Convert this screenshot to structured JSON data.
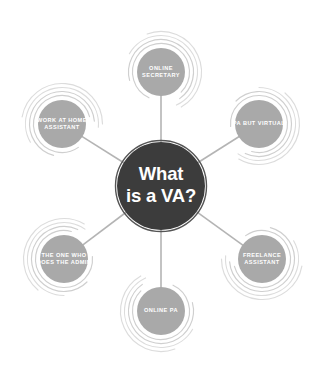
{
  "diagram": {
    "type": "mind-map",
    "background_color": "#ffffff",
    "center": {
      "id": "center-node",
      "lines": [
        "What",
        "is a VA?"
      ],
      "fill_color": "#3c3c3c",
      "text_color": "#ffffff",
      "cx": 161,
      "cy": 186,
      "r": 44
    },
    "node_style": {
      "fill_color": "#a9a9a9",
      "text_color": "#ffffff",
      "arc_color": "#cfcfcf",
      "connector_color": "#b4b4b4",
      "radius": 24
    },
    "nodes": [
      {
        "id": "node-online-secretary",
        "name": "online-secretary",
        "lines": [
          "ONLINE",
          "SECRETARY"
        ],
        "cx": 161,
        "cy": 72,
        "angle": -90
      },
      {
        "id": "node-pa-but-virtual",
        "name": "pa-but-virtual",
        "lines": [
          "PA BUT VIRTUAL"
        ],
        "cx": 259,
        "cy": 124,
        "angle": -30
      },
      {
        "id": "node-freelance-assistant",
        "name": "freelance-assistant",
        "lines": [
          "FREELANCE",
          "ASSISTANT"
        ],
        "cx": 262,
        "cy": 259,
        "angle": 30
      },
      {
        "id": "node-online-pa",
        "name": "online-pa",
        "lines": [
          "ONLINE PA"
        ],
        "cx": 161,
        "cy": 311,
        "angle": 90
      },
      {
        "id": "node-the-one-who-does-the-admin",
        "name": "the-one-who-does-the-admin",
        "lines": [
          "THE ONE WHO",
          "DOES THE ADMIN"
        ],
        "cx": 64,
        "cy": 259,
        "angle": 150
      },
      {
        "id": "node-work-at-home-assistant",
        "name": "work-at-home-assistant",
        "lines": [
          "WORK AT HOME",
          "ASSISTANT"
        ],
        "cx": 62,
        "cy": 124,
        "angle": 210
      }
    ]
  }
}
